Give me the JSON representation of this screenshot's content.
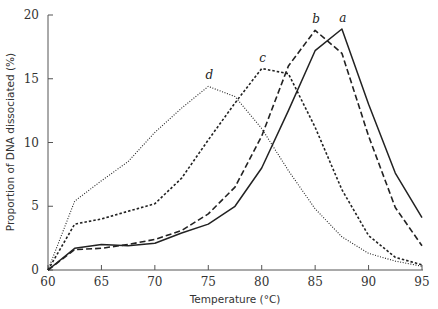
{
  "chart_data": {
    "type": "line",
    "title": "",
    "xlabel": "Temperature (°C)",
    "ylabel": "Proportion of DNA dissociated (%)",
    "xlim": [
      60,
      95
    ],
    "ylim": [
      0,
      20
    ],
    "xticks": [
      60,
      65,
      70,
      75,
      80,
      85,
      90,
      95
    ],
    "yticks": [
      0,
      5,
      10,
      15,
      20
    ],
    "grid": false,
    "legend": "none (inline labels at peaks)",
    "series": [
      {
        "name": "a",
        "style": "solid",
        "x": [
          60,
          62.5,
          65,
          67.5,
          70,
          72.5,
          75,
          77.5,
          80,
          82.5,
          85,
          87.5,
          90,
          92.5,
          95
        ],
        "y": [
          0,
          1.7,
          2.0,
          1.9,
          2.1,
          2.9,
          3.6,
          5.0,
          8.0,
          12.5,
          17.2,
          18.9,
          13.0,
          7.6,
          4.1
        ]
      },
      {
        "name": "b",
        "style": "dashed",
        "x": [
          60,
          62.5,
          65,
          67.5,
          70,
          72.5,
          75,
          77.5,
          80,
          82.5,
          85,
          87.5,
          90,
          92.5,
          95
        ],
        "y": [
          0,
          1.6,
          1.7,
          2.0,
          2.4,
          3.1,
          4.4,
          6.5,
          10.5,
          16.0,
          18.8,
          17.0,
          10.5,
          4.9,
          1.9
        ]
      },
      {
        "name": "c",
        "style": "short-dashed",
        "x": [
          60,
          62.5,
          65,
          67.5,
          70,
          72.5,
          75,
          77.5,
          80,
          82.5,
          85,
          87.5,
          90,
          92.5,
          95
        ],
        "y": [
          0,
          3.6,
          4.0,
          4.6,
          5.2,
          7.2,
          10.2,
          13.1,
          15.8,
          15.4,
          11.2,
          6.3,
          2.7,
          1.0,
          0.4
        ]
      },
      {
        "name": "d",
        "style": "dotted",
        "x": [
          60,
          62.5,
          65,
          67.5,
          70,
          72.5,
          75,
          77.5,
          80,
          82.5,
          85,
          87.5,
          90,
          92.5,
          95
        ],
        "y": [
          0,
          5.4,
          7.0,
          8.5,
          10.8,
          12.7,
          14.4,
          13.6,
          11.1,
          7.8,
          4.8,
          2.6,
          1.3,
          0.7,
          0.3
        ]
      }
    ],
    "annotations": [
      {
        "text": "a",
        "x": 87.5,
        "y": 18.9
      },
      {
        "text": "b",
        "x": 85,
        "y": 18.8
      },
      {
        "text": "c",
        "x": 80,
        "y": 15.8
      },
      {
        "text": "d",
        "x": 75,
        "y": 14.4
      }
    ]
  }
}
